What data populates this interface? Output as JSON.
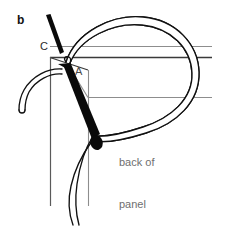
{
  "figure": {
    "panel_letter": "b",
    "width_px": 227,
    "height_px": 236,
    "background_color": "#ffffff"
  },
  "labels": {
    "panel_letter": "b",
    "point_c": "C",
    "point_a": "A",
    "back_of_panel_line1": "back of",
    "back_of_panel_line2": "panel"
  },
  "colors": {
    "ink": "#111111",
    "needle": "#0a0a0a",
    "panel_line_gray": "#8d8d8d",
    "panel_line_dark": "#3a3a3a",
    "annotation_gray": "#6f6f6f",
    "background": "#ffffff"
  },
  "elements": {
    "needle_top": "diagonal black needle entering at point C",
    "needle_main": "thick tapered black needle from point A passing down through panel",
    "thread_loop": "large thread loop curving right and back",
    "thread_tail_left": "thread end curving to lower left",
    "thread_tail_bottom": "thread end running down past bottom edge",
    "panel_edges": "three horizontal rules and two vertical rules representing panel edges"
  }
}
